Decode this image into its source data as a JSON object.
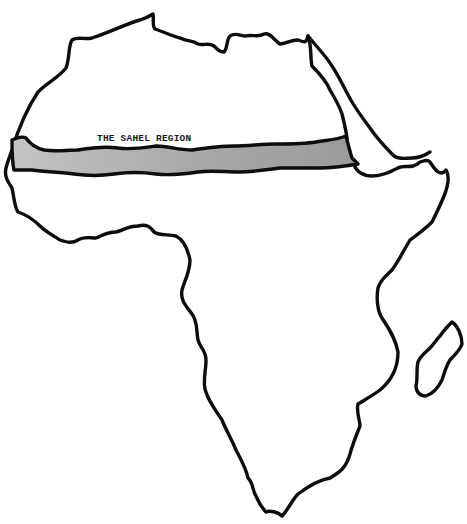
{
  "map": {
    "title": "THE SAHEL REGION",
    "subject": "Africa",
    "highlighted_region": {
      "name": "THE SAHEL REGION",
      "fill_color": "#a9a9a9",
      "outline_color": "#0d0d0d"
    },
    "features": [
      {
        "name": "africa-continent-outline",
        "type": "coastline"
      },
      {
        "name": "red-sea-outline",
        "type": "coastline"
      },
      {
        "name": "madagascar-outline",
        "type": "island"
      },
      {
        "name": "sahel-band",
        "type": "highlighted-region"
      }
    ],
    "colors": {
      "background": "#ffffff",
      "land": "#ffffff",
      "outline": "#0d0d0d",
      "sahel_fill": "#a9a9a9"
    }
  }
}
